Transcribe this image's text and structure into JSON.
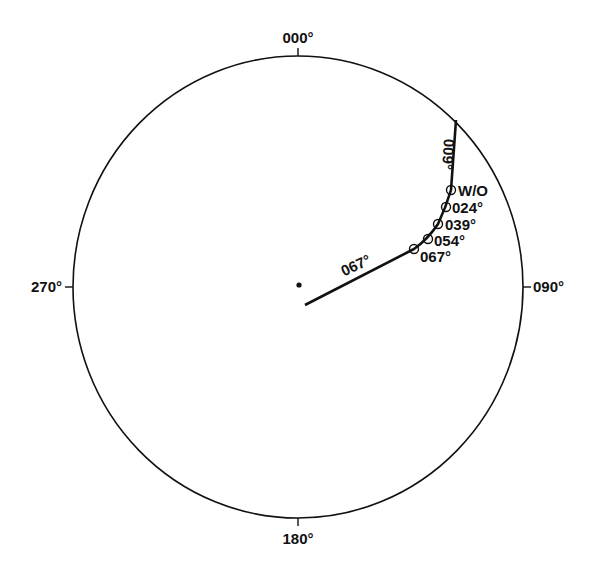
{
  "diagram": {
    "type": "polar-heading-plot",
    "colors": {
      "ink": "#111111",
      "background": "#ffffff"
    },
    "compass": {
      "north_label": "000°",
      "east_label": "090°",
      "south_label": "180°",
      "west_label": "270°"
    },
    "track": {
      "initial_leg_label": "009°",
      "final_leg_label": "067°",
      "markers": [
        {
          "label": "W/O"
        },
        {
          "label": "024°"
        },
        {
          "label": "039°"
        },
        {
          "label": "054°"
        },
        {
          "label": "067°"
        }
      ]
    }
  }
}
